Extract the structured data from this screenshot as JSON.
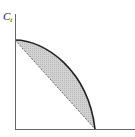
{
  "diagram": {
    "type": "production-possibility-frontier",
    "y_axis_label": {
      "main": "C",
      "subscript": "t"
    },
    "x_axis_label": "",
    "curve": {
      "style": "solid",
      "shape": "concave",
      "color": "#222222"
    },
    "chord": {
      "style": "dashed",
      "color": "#444444"
    },
    "shaded_region": {
      "description": "area between concave frontier and straight dashed chord",
      "color": "#c9c9c9"
    },
    "axes_color": "#555555"
  }
}
